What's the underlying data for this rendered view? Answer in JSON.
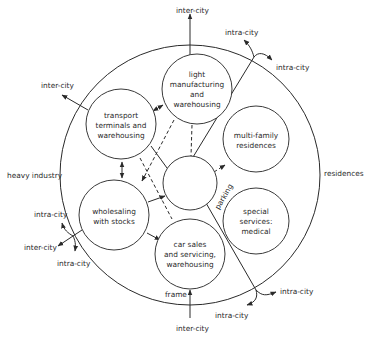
{
  "diagram": {
    "type": "zoning-diagram",
    "colors": {
      "stroke": "#2a2a2a",
      "background": "#ffffff"
    },
    "zones": {
      "light_manufacturing": [
        "light",
        "manufacturing",
        "and",
        "warehousing"
      ],
      "transport_terminals": [
        "transport",
        "terminals and",
        "warehousing"
      ],
      "wholesaling": [
        "wholesaling",
        "with stocks"
      ],
      "car_sales": [
        "car sales",
        "and servicing,",
        "warehousing"
      ],
      "multi_family": [
        "multi-family",
        "residences"
      ],
      "special_services": [
        "special",
        "services:",
        "medical"
      ],
      "center": ""
    },
    "outer_labels": {
      "heavy_industry": "heavy industry",
      "residences": "residences",
      "frame": "frame",
      "parking": "parking"
    },
    "road_labels": {
      "top_inter_city": "inter-city",
      "left_inter_city": "inter-city",
      "top_right_intra_city_1": "intra-city",
      "top_right_intra_city_2": "intra-city",
      "left_intra_city_upper": "intra-city",
      "left_inter_city_lower": "inter-city",
      "left_intra_city_lower": "intra-city",
      "bottom_inter_city": "inter-city",
      "bottom_right_intra_city_1": "intra-city",
      "bottom_right_intra_city_2": "intra-city"
    }
  }
}
